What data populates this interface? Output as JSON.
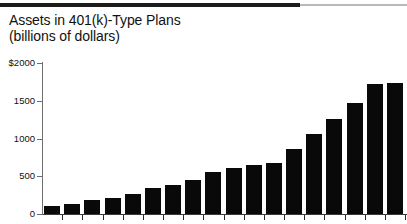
{
  "figure": {
    "title_line_1": "Assets in 401(k)-Type Plans",
    "title_line_2": "(billions of dollars)",
    "top_rule": "horizontal-rule"
  },
  "axis": {
    "y_unit_label": "$2000",
    "y_tick_labels": [
      "$2000",
      "1500",
      "1000",
      "500",
      "0"
    ],
    "y_tick_values": [
      2000,
      1500,
      1000,
      500,
      0
    ]
  },
  "chart_data": {
    "type": "bar",
    "title": "Assets in 401(k)-Type Plans",
    "subtitle": "(billions of dollars)",
    "xlabel": "",
    "ylabel": "billions of dollars",
    "ylim": [
      0,
      2000
    ],
    "yticks": [
      0,
      500,
      1000,
      1500,
      2000
    ],
    "ytick_labels": [
      "0",
      "500",
      "1000",
      "1500",
      "$2000"
    ],
    "grid": false,
    "legend": false,
    "bar_color": "#090909",
    "categories": [
      "1",
      "2",
      "3",
      "4",
      "5",
      "6",
      "7",
      "8",
      "9",
      "10",
      "11",
      "12",
      "13",
      "14",
      "15",
      "16",
      "17",
      "18"
    ],
    "values": [
      100,
      135,
      180,
      215,
      270,
      350,
      390,
      450,
      550,
      610,
      645,
      675,
      860,
      1060,
      1265,
      1470,
      1720,
      1730
    ],
    "n_bars": 18
  }
}
